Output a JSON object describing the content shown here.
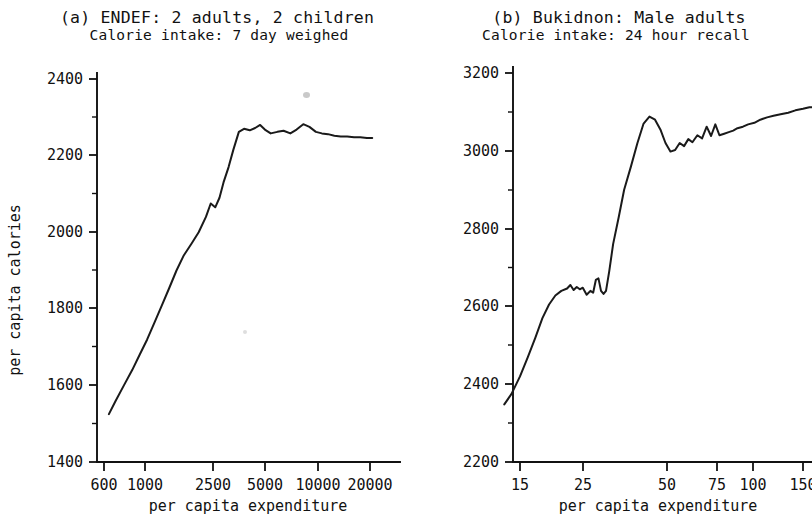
{
  "figure": {
    "background": "#ffffff",
    "ink_color": "#111111"
  },
  "panels": [
    {
      "id": "a",
      "title_line1": "(a) ENDEF: 2 adults, 2 children",
      "title_line2": "Calorie intake: 7 day weighed",
      "xlabel": "per capita expenditure",
      "ylabel": "per capita calories"
    },
    {
      "id": "b",
      "title_line1": "(b) Bukidnon: Male adults",
      "title_line2": "Calorie intake: 24 hour recall",
      "xlabel": "per capita expenditure",
      "ylabel": ""
    }
  ],
  "chart_data": [
    {
      "type": "line",
      "id": "panel-a",
      "title": "(a) ENDEF: 2 adults, 2 children",
      "subtitle": "Calorie intake: 7 day weighed",
      "xlabel": "per capita expenditure",
      "ylabel": "per capita calories",
      "xscale": "log",
      "xticks": [
        600,
        1000,
        2500,
        5000,
        10000,
        20000
      ],
      "xticklabels": [
        "600",
        "1000",
        "2500",
        "5000",
        "10000",
        "20000"
      ],
      "xlim": [
        560,
        23000
      ],
      "yticks": [
        1400,
        1600,
        1800,
        2000,
        2200,
        2400
      ],
      "yticklabels": [
        "1400",
        "1600",
        "1800",
        "2000",
        "2200",
        "2400"
      ],
      "ylim": [
        1400,
        2500
      ],
      "minor_ticks": true,
      "grid": false,
      "legend": "none",
      "series": [
        {
          "name": "calorie intake",
          "x": [
            640,
            700,
            780,
            870,
            960,
            1060,
            1170,
            1290,
            1420,
            1560,
            1720,
            1900,
            2090,
            2300,
            2450,
            2600,
            2750,
            2900,
            3100,
            3300,
            3550,
            3800,
            4100,
            4400,
            4700,
            5000,
            5400,
            5900,
            6400,
            7000,
            7600,
            8300,
            9000,
            9800,
            10600,
            11500,
            12500,
            13600,
            14800,
            16200,
            17600,
            19200,
            20600
          ],
          "y": [
            1525,
            1560,
            1600,
            1640,
            1680,
            1720,
            1765,
            1810,
            1855,
            1900,
            1940,
            1970,
            2000,
            2040,
            2075,
            2065,
            2090,
            2130,
            2170,
            2215,
            2262,
            2270,
            2266,
            2272,
            2280,
            2268,
            2258,
            2262,
            2265,
            2258,
            2268,
            2282,
            2275,
            2262,
            2258,
            2256,
            2252,
            2250,
            2250,
            2248,
            2248,
            2246,
            2246
          ]
        }
      ]
    },
    {
      "type": "line",
      "id": "panel-b",
      "title": "(b) Bukidnon: Male adults",
      "subtitle": "Calorie intake: 24 hour recall",
      "xlabel": "per capita expenditure",
      "ylabel": "",
      "xscale": "log",
      "xticks": [
        15,
        25,
        50,
        75,
        100,
        150
      ],
      "xticklabels": [
        "15",
        "25",
        "50",
        "75",
        "100",
        "150"
      ],
      "xlim": [
        12.5,
        175
      ],
      "yticks": [
        2200,
        2400,
        2600,
        2800,
        3000,
        3200
      ],
      "yticklabels": [
        "2200",
        "2400",
        "2600",
        "2800",
        "3000",
        "3200"
      ],
      "ylim": [
        2200,
        3260
      ],
      "minor_ticks": true,
      "grid": false,
      "legend": "none",
      "series": [
        {
          "name": "calorie intake",
          "x": [
            13.2,
            14.0,
            15.0,
            16.0,
            17.0,
            18.0,
            19.0,
            20.0,
            21.0,
            22.0,
            22.6,
            23.2,
            23.8,
            24.4,
            25.0,
            25.8,
            26.6,
            27.2,
            27.8,
            28.4,
            29.0,
            29.6,
            30.2,
            31.0,
            32.0,
            33.5,
            35.0,
            37.0,
            39.0,
            41.0,
            43.0,
            45.0,
            47.0,
            49.0,
            51.0,
            53.0,
            55.0,
            57.0,
            59.0,
            61.0,
            63.5,
            66.0,
            68.5,
            71.0,
            73.5,
            76.0,
            79.0,
            82.0,
            85.0,
            88.0,
            92.0,
            96.0,
            101.0,
            106.0,
            112.0,
            118.0,
            125.0,
            133.0,
            141.0,
            150.0,
            158.0,
            166.0
          ],
          "y": [
            2348,
            2375,
            2420,
            2470,
            2520,
            2570,
            2605,
            2628,
            2640,
            2646,
            2655,
            2642,
            2650,
            2644,
            2648,
            2630,
            2640,
            2635,
            2668,
            2672,
            2640,
            2632,
            2640,
            2690,
            2760,
            2830,
            2900,
            2960,
            3020,
            3070,
            3088,
            3080,
            3055,
            3020,
            2998,
            3002,
            3020,
            3012,
            3030,
            3022,
            3040,
            3032,
            3062,
            3038,
            3068,
            3040,
            3044,
            3048,
            3052,
            3058,
            3062,
            3068,
            3072,
            3080,
            3086,
            3090,
            3094,
            3098,
            3104,
            3108,
            3112,
            3112
          ]
        }
      ]
    }
  ]
}
